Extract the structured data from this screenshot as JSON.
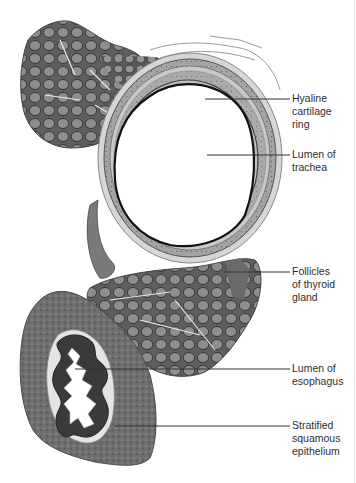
{
  "figure": {
    "colors": {
      "background": "#ffffff",
      "follicle_fill": "#8c8c8c",
      "follicle_stroke": "#3a3a3a",
      "tissue_dark": "#5a5a5a",
      "tissue_mid": "#7a7a7a",
      "cartilage": "#a8a8a8",
      "leader_line": "#333333",
      "label_text": "#2e2e2e"
    }
  },
  "labels": [
    {
      "id": "hyaline",
      "text": "Hyaline\ncartilage\nring",
      "top": 92,
      "line": {
        "x1": 205,
        "y": 99,
        "x2": 290
      }
    },
    {
      "id": "lumen_trachea",
      "text": "Lumen of\ntrachea",
      "top": 148,
      "line": {
        "x1": 207,
        "y": 155,
        "x2": 290
      }
    },
    {
      "id": "thyroid",
      "text": "Follicles\nof thyroid\ngland",
      "top": 265,
      "line": {
        "x1": 224,
        "y": 272,
        "x2": 290
      }
    },
    {
      "id": "lumen_esophagus",
      "text": "Lumen of\nesophagus",
      "top": 362,
      "line": {
        "x1": 75,
        "y": 369,
        "x2": 290
      }
    },
    {
      "id": "epithelium",
      "text": "Stratified\nsquamous\nepithelium",
      "top": 419,
      "line": {
        "x1": 115,
        "y": 426,
        "x2": 290
      }
    }
  ]
}
